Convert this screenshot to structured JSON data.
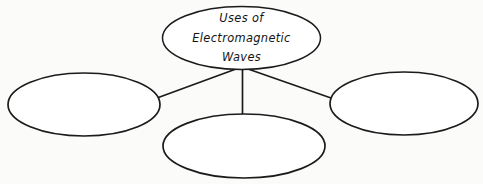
{
  "document": {
    "kind": "concept-map",
    "title": "Uses of Electromagnetic Waves",
    "background_color": "#fbfbfa",
    "ink_color": "#1b1b1b"
  },
  "center_node": {
    "name": "center-node",
    "label_lines": [
      "Uses of",
      "Electromagnetic",
      "Waves"
    ],
    "full_label": "Uses of Electromagnetic Waves",
    "shape": "ellipse",
    "cx": 241.5,
    "cy": 38,
    "rx": 79,
    "ry": 31.5,
    "filled": false
  },
  "branch_nodes": [
    {
      "name": "branch-node-left",
      "position": "left",
      "label": "",
      "shape": "ellipse",
      "cx": 84,
      "cy": 104.5,
      "rx": 76,
      "ry": 31.5,
      "filled": false
    },
    {
      "name": "branch-node-bottom",
      "position": "bottom-center",
      "label": "",
      "shape": "ellipse",
      "cx": 244,
      "cy": 146,
      "rx": 81,
      "ry": 32,
      "filled": false
    },
    {
      "name": "branch-node-right",
      "position": "right",
      "label": "",
      "shape": "ellipse",
      "cx": 404,
      "cy": 103.5,
      "rx": 74,
      "ry": 31.5,
      "filled": false
    }
  ],
  "connectors": [
    {
      "name": "connector-center-to-left",
      "from": "center-node",
      "to": "branch-node-left",
      "x1": 236,
      "y1": 69,
      "x2": 157,
      "y2": 98
    },
    {
      "name": "connector-center-to-bottom",
      "from": "center-node",
      "to": "branch-node-bottom",
      "x1": 242.5,
      "y1": 69,
      "x2": 242.5,
      "y2": 115
    },
    {
      "name": "connector-center-to-right",
      "from": "center-node",
      "to": "branch-node-right",
      "x1": 248,
      "y1": 69,
      "x2": 331,
      "y2": 98
    }
  ]
}
